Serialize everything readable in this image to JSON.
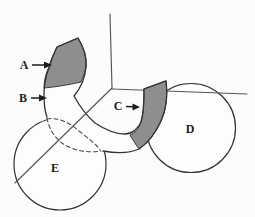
{
  "figure": {
    "labels": {
      "a": "A",
      "b": "B",
      "c": "C",
      "d": "D",
      "e": "E"
    },
    "colors": {
      "shaded_segment": "#8e8e8e",
      "outline": "#333333",
      "construction_line": "#555555",
      "background": "#fcfcfc"
    }
  }
}
